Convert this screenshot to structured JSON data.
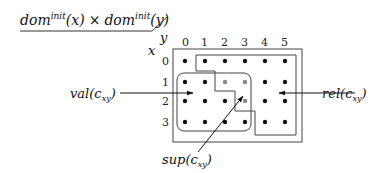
{
  "title": {
    "dom": "dom",
    "sup": "init",
    "x_arg": "(x)",
    "times": "×",
    "y_arg": "(y)"
  },
  "axes": {
    "y_label": "y",
    "x_label": "x",
    "col_labels": [
      "0",
      "1",
      "2",
      "3",
      "4",
      "5"
    ],
    "row_labels": [
      "0",
      "1",
      "2",
      "3"
    ]
  },
  "labels": {
    "val": {
      "name": "val",
      "sub": "xy"
    },
    "rel": {
      "name": "rel",
      "sub": "xy"
    },
    "sup": {
      "name": "sup",
      "sub": "xy"
    }
  },
  "grid": {
    "rows": 4,
    "cols": 6,
    "gray_points": [
      [
        1,
        2
      ],
      [
        1,
        3
      ],
      [
        2,
        3
      ]
    ],
    "colors": {
      "dot": "#111111",
      "gray_dot": "#888888",
      "line": "#444444"
    }
  }
}
